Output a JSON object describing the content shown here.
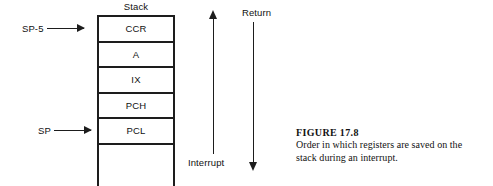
{
  "stack": {
    "title": "Stack",
    "cells": [
      {
        "label": "CCR"
      },
      {
        "label": "A"
      },
      {
        "label": "IX"
      },
      {
        "label": "PCH"
      },
      {
        "label": "PCL"
      }
    ]
  },
  "pointers": [
    {
      "label": "SP-5",
      "target_cell": "CCR"
    },
    {
      "label": "SP",
      "target_cell": "PCL"
    }
  ],
  "flow": {
    "up_arrow_label": "Interrupt",
    "down_arrow_label": "Return"
  },
  "caption": {
    "title": "FIGURE 17.8",
    "line1": "Order in which registers are saved on the",
    "line2": "stack during an interrupt."
  },
  "colors": {
    "ink": "#1d1d1d",
    "background": "#ffffff"
  }
}
